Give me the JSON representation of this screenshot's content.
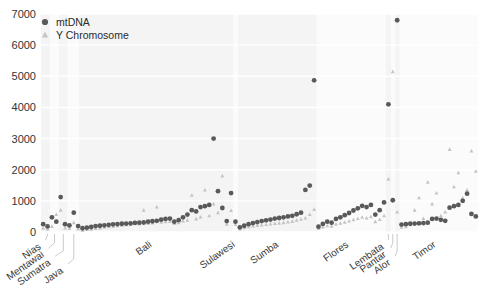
{
  "chart_data": {
    "type": "scatter",
    "title": "",
    "xlabel": "",
    "ylabel": "",
    "ylim": [
      0,
      7000
    ],
    "yticks": [
      0,
      1000,
      2000,
      3000,
      4000,
      5000,
      6000,
      7000
    ],
    "ytick_labels": [
      "0",
      "1000",
      "2000",
      "3000",
      "4000",
      "5000",
      "6000",
      "7000"
    ],
    "grid": true,
    "legend_position": "top-left",
    "legend": [
      {
        "name": "mtDNA",
        "marker": "circle",
        "color": "#595959"
      },
      {
        "name": "Y Chromosome",
        "marker": "triangle",
        "color": "#c4c4c4"
      }
    ],
    "x_group_labels": [
      "Nias",
      "Mentawai",
      "Sumatra",
      "Java",
      "Bali",
      "Sulawesi",
      "Sumba",
      "Flores",
      "Lembata",
      "Pantar",
      "Alor",
      "Timor"
    ],
    "series": [
      {
        "name": "mtDNA",
        "marker": "circle",
        "color": "#595959",
        "points": [
          {
            "x": 1,
            "y": 250
          },
          {
            "x": 2,
            "y": 180
          },
          {
            "x": 3,
            "y": 470
          },
          {
            "x": 4,
            "y": 330
          },
          {
            "x": 5,
            "y": 1120
          },
          {
            "x": 6,
            "y": 250
          },
          {
            "x": 7,
            "y": 210
          },
          {
            "x": 8,
            "y": 620
          },
          {
            "x": 9,
            "y": 190
          },
          {
            "x": 10,
            "y": 120
          },
          {
            "x": 11,
            "y": 140
          },
          {
            "x": 12,
            "y": 160
          },
          {
            "x": 13,
            "y": 190
          },
          {
            "x": 14,
            "y": 200
          },
          {
            "x": 15,
            "y": 215
          },
          {
            "x": 16,
            "y": 230
          },
          {
            "x": 17,
            "y": 245
          },
          {
            "x": 18,
            "y": 255
          },
          {
            "x": 19,
            "y": 265
          },
          {
            "x": 20,
            "y": 270
          },
          {
            "x": 21,
            "y": 280
          },
          {
            "x": 22,
            "y": 290
          },
          {
            "x": 23,
            "y": 300
          },
          {
            "x": 24,
            "y": 305
          },
          {
            "x": 25,
            "y": 330
          },
          {
            "x": 26,
            "y": 345
          },
          {
            "x": 27,
            "y": 360
          },
          {
            "x": 28,
            "y": 395
          },
          {
            "x": 29,
            "y": 420
          },
          {
            "x": 30,
            "y": 430
          },
          {
            "x": 31,
            "y": 330
          },
          {
            "x": 32,
            "y": 380
          },
          {
            "x": 33,
            "y": 470
          },
          {
            "x": 34,
            "y": 560
          },
          {
            "x": 35,
            "y": 700
          },
          {
            "x": 36,
            "y": 660
          },
          {
            "x": 37,
            "y": 800
          },
          {
            "x": 38,
            "y": 830
          },
          {
            "x": 39,
            "y": 870
          },
          {
            "x": 40,
            "y": 3000
          },
          {
            "x": 41,
            "y": 1310
          },
          {
            "x": 42,
            "y": 770
          },
          {
            "x": 43,
            "y": 350
          },
          {
            "x": 44,
            "y": 1250
          },
          {
            "x": 45,
            "y": 330
          },
          {
            "x": 46,
            "y": 150
          },
          {
            "x": 47,
            "y": 200
          },
          {
            "x": 48,
            "y": 250
          },
          {
            "x": 49,
            "y": 285
          },
          {
            "x": 50,
            "y": 320
          },
          {
            "x": 51,
            "y": 350
          },
          {
            "x": 52,
            "y": 375
          },
          {
            "x": 53,
            "y": 400
          },
          {
            "x": 54,
            "y": 430
          },
          {
            "x": 55,
            "y": 450
          },
          {
            "x": 56,
            "y": 470
          },
          {
            "x": 57,
            "y": 500
          },
          {
            "x": 58,
            "y": 520
          },
          {
            "x": 59,
            "y": 570
          },
          {
            "x": 60,
            "y": 620
          },
          {
            "x": 61,
            "y": 1350
          },
          {
            "x": 62,
            "y": 1490
          },
          {
            "x": 63,
            "y": 4870
          },
          {
            "x": 64,
            "y": 170
          },
          {
            "x": 65,
            "y": 260
          },
          {
            "x": 66,
            "y": 330
          },
          {
            "x": 67,
            "y": 300
          },
          {
            "x": 68,
            "y": 420
          },
          {
            "x": 69,
            "y": 470
          },
          {
            "x": 70,
            "y": 540
          },
          {
            "x": 71,
            "y": 610
          },
          {
            "x": 72,
            "y": 690
          },
          {
            "x": 73,
            "y": 760
          },
          {
            "x": 74,
            "y": 840
          },
          {
            "x": 75,
            "y": 800
          },
          {
            "x": 76,
            "y": 870
          },
          {
            "x": 77,
            "y": 560
          },
          {
            "x": 78,
            "y": 700
          },
          {
            "x": 79,
            "y": 950
          },
          {
            "x": 80,
            "y": 4100
          },
          {
            "x": 81,
            "y": 1020
          },
          {
            "x": 82,
            "y": 6800
          },
          {
            "x": 83,
            "y": 240
          },
          {
            "x": 84,
            "y": 250
          },
          {
            "x": 85,
            "y": 265
          },
          {
            "x": 86,
            "y": 270
          },
          {
            "x": 87,
            "y": 280
          },
          {
            "x": 88,
            "y": 285
          },
          {
            "x": 89,
            "y": 300
          },
          {
            "x": 90,
            "y": 420
          },
          {
            "x": 91,
            "y": 430
          },
          {
            "x": 92,
            "y": 390
          },
          {
            "x": 93,
            "y": 360
          },
          {
            "x": 94,
            "y": 780
          },
          {
            "x": 95,
            "y": 830
          },
          {
            "x": 96,
            "y": 870
          },
          {
            "x": 97,
            "y": 1000
          },
          {
            "x": 98,
            "y": 1230
          },
          {
            "x": 99,
            "y": 580
          },
          {
            "x": 100,
            "y": 500
          }
        ]
      },
      {
        "name": "Y Chromosome",
        "marker": "triangle",
        "color": "#c4c4c4",
        "points": [
          {
            "x": 1,
            "y": 120
          },
          {
            "x": 2,
            "y": 90
          },
          {
            "x": 3,
            "y": 180
          },
          {
            "x": 4,
            "y": 560
          },
          {
            "x": 5,
            "y": 700
          },
          {
            "x": 6,
            "y": 130
          },
          {
            "x": 7,
            "y": 110
          },
          {
            "x": 8,
            "y": 300
          },
          {
            "x": 9,
            "y": 100
          },
          {
            "x": 10,
            "y": 60
          },
          {
            "x": 11,
            "y": 80
          },
          {
            "x": 12,
            "y": 90
          },
          {
            "x": 13,
            "y": 110
          },
          {
            "x": 14,
            "y": 130
          },
          {
            "x": 15,
            "y": 150
          },
          {
            "x": 16,
            "y": 165
          },
          {
            "x": 17,
            "y": 180
          },
          {
            "x": 18,
            "y": 200
          },
          {
            "x": 19,
            "y": 215
          },
          {
            "x": 20,
            "y": 230
          },
          {
            "x": 21,
            "y": 240
          },
          {
            "x": 22,
            "y": 320
          },
          {
            "x": 23,
            "y": 255
          },
          {
            "x": 24,
            "y": 700
          },
          {
            "x": 25,
            "y": 270
          },
          {
            "x": 26,
            "y": 290
          },
          {
            "x": 27,
            "y": 800
          },
          {
            "x": 28,
            "y": 310
          },
          {
            "x": 29,
            "y": 330
          },
          {
            "x": 30,
            "y": 340
          },
          {
            "x": 31,
            "y": 270
          },
          {
            "x": 32,
            "y": 300
          },
          {
            "x": 33,
            "y": 350
          },
          {
            "x": 34,
            "y": 380
          },
          {
            "x": 35,
            "y": 1180
          },
          {
            "x": 36,
            "y": 420
          },
          {
            "x": 37,
            "y": 480
          },
          {
            "x": 38,
            "y": 1350
          },
          {
            "x": 39,
            "y": 520
          },
          {
            "x": 40,
            "y": 900
          },
          {
            "x": 41,
            "y": 620
          },
          {
            "x": 42,
            "y": 1800
          },
          {
            "x": 43,
            "y": 250
          },
          {
            "x": 44,
            "y": 690
          },
          {
            "x": 45,
            "y": 240
          },
          {
            "x": 46,
            "y": 100
          },
          {
            "x": 47,
            "y": 140
          },
          {
            "x": 48,
            "y": 170
          },
          {
            "x": 49,
            "y": 190
          },
          {
            "x": 50,
            "y": 210
          },
          {
            "x": 51,
            "y": 225
          },
          {
            "x": 52,
            "y": 240
          },
          {
            "x": 53,
            "y": 255
          },
          {
            "x": 54,
            "y": 270
          },
          {
            "x": 55,
            "y": 285
          },
          {
            "x": 56,
            "y": 300
          },
          {
            "x": 57,
            "y": 320
          },
          {
            "x": 58,
            "y": 340
          },
          {
            "x": 59,
            "y": 380
          },
          {
            "x": 60,
            "y": 410
          },
          {
            "x": 61,
            "y": 450
          },
          {
            "x": 62,
            "y": 560
          },
          {
            "x": 63,
            "y": 720
          },
          {
            "x": 64,
            "y": 110
          },
          {
            "x": 65,
            "y": 160
          },
          {
            "x": 66,
            "y": 200
          },
          {
            "x": 67,
            "y": 185
          },
          {
            "x": 68,
            "y": 250
          },
          {
            "x": 69,
            "y": 280
          },
          {
            "x": 70,
            "y": 310
          },
          {
            "x": 71,
            "y": 350
          },
          {
            "x": 72,
            "y": 390
          },
          {
            "x": 73,
            "y": 430
          },
          {
            "x": 74,
            "y": 470
          },
          {
            "x": 75,
            "y": 450
          },
          {
            "x": 76,
            "y": 490
          },
          {
            "x": 77,
            "y": 330
          },
          {
            "x": 78,
            "y": 400
          },
          {
            "x": 79,
            "y": 520
          },
          {
            "x": 80,
            "y": 1700
          },
          {
            "x": 81,
            "y": 5150
          },
          {
            "x": 82,
            "y": 640
          },
          {
            "x": 83,
            "y": 150
          },
          {
            "x": 84,
            "y": 170
          },
          {
            "x": 85,
            "y": 260
          },
          {
            "x": 86,
            "y": 700
          },
          {
            "x": 87,
            "y": 1100
          },
          {
            "x": 88,
            "y": 430
          },
          {
            "x": 89,
            "y": 1600
          },
          {
            "x": 90,
            "y": 900
          },
          {
            "x": 91,
            "y": 1250
          },
          {
            "x": 92,
            "y": 520
          },
          {
            "x": 93,
            "y": 640
          },
          {
            "x": 94,
            "y": 2650
          },
          {
            "x": 95,
            "y": 1450
          },
          {
            "x": 96,
            "y": 1900
          },
          {
            "x": 97,
            "y": 1100
          },
          {
            "x": 98,
            "y": 1350
          },
          {
            "x": 99,
            "y": 2600
          },
          {
            "x": 100,
            "y": 1950
          }
        ]
      }
    ],
    "group_bands": [
      {
        "label": "Nias",
        "x_start": 0.5,
        "x_end": 2.6,
        "shaded": true,
        "tick_x": 2.0
      },
      {
        "label": "Mentawai",
        "x_start": 2.6,
        "x_end": 4.6,
        "shaded": false,
        "tick_x": 3.6
      },
      {
        "label": "Sumatra",
        "x_start": 4.6,
        "x_end": 6.6,
        "shaded": true,
        "tick_x": 5.6
      },
      {
        "label": "Java",
        "x_start": 6.6,
        "x_end": 9.2,
        "shaded": false,
        "tick_x": 8.0
      },
      {
        "label": "Bali",
        "x_start": 9.2,
        "x_end": 44.5,
        "shaded": true,
        "tick_x": 26.0
      },
      {
        "label": "Sulawesi",
        "x_start": 44.5,
        "x_end": 45.6,
        "shaded": false,
        "tick_x": 45.0
      },
      {
        "label": "Sumba",
        "x_start": 45.6,
        "x_end": 63.6,
        "shaded": true,
        "tick_x": 55.0
      },
      {
        "label": "Flores",
        "x_start": 63.6,
        "x_end": 79.4,
        "shaded": false,
        "tick_x": 71.0
      },
      {
        "label": "Lembata",
        "x_start": 79.4,
        "x_end": 80.6,
        "shaded": true,
        "tick_x": 80.0
      },
      {
        "label": "Pantar",
        "x_start": 80.6,
        "x_end": 81.6,
        "shaded": false,
        "tick_x": 81.0
      },
      {
        "label": "Alor",
        "x_start": 81.6,
        "x_end": 82.6,
        "shaded": true,
        "tick_x": 82.0
      },
      {
        "label": "Timor",
        "x_start": 82.6,
        "x_end": 100.5,
        "shaded": false,
        "tick_x": 91.0
      }
    ]
  }
}
